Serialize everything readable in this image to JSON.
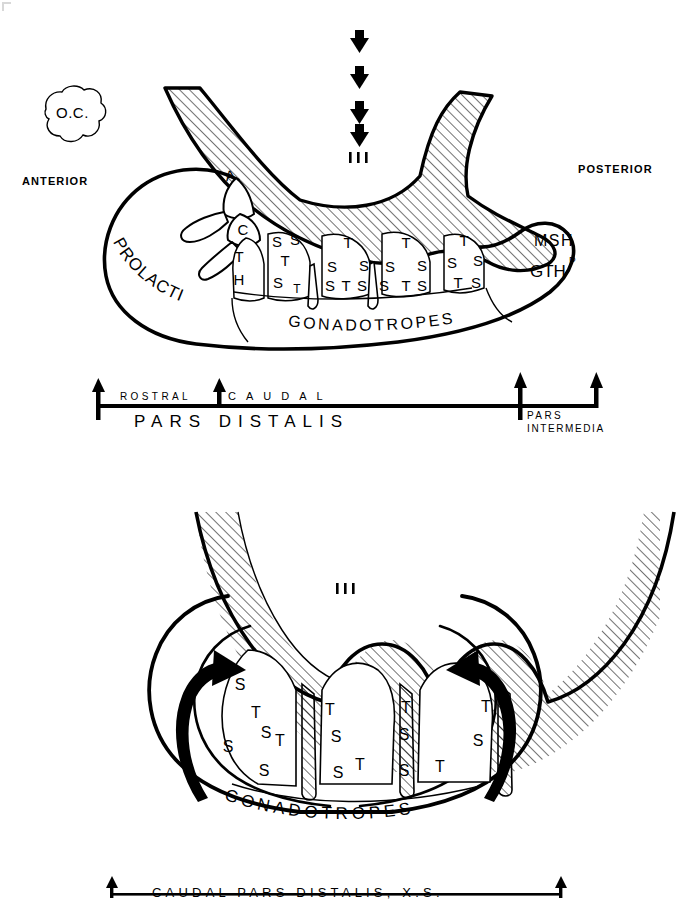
{
  "figure": {
    "type": "anatomical-diagram"
  },
  "panel_top": {
    "name": "sagittal-view",
    "labels": {
      "optic_chiasma": "O.C.",
      "anterior": "ANTERIOR",
      "posterior": "POSTERIOR",
      "ventricle": "III",
      "prolactin": "PROLACTIN",
      "gonadotropes": "GONADOTROPES",
      "msh": "MSH",
      "gth": "GTH",
      "gth_superscript": "P",
      "lobe_a": "A",
      "lobe_c": "C"
    },
    "arrows_down": 4,
    "cell_clusters": [
      {
        "name": "thyrotrope-cluster-1",
        "letters": [
          "T",
          "H"
        ]
      },
      {
        "name": "cluster-2",
        "letters": [
          "S",
          "S",
          "T",
          "S",
          "T"
        ]
      },
      {
        "name": "cluster-3",
        "letters": [
          "T",
          "S",
          "S",
          "S",
          "T",
          "S"
        ]
      },
      {
        "name": "cluster-4",
        "letters": [
          "T",
          "S",
          "S",
          "S",
          "T",
          "S"
        ]
      }
    ]
  },
  "scale_bar": {
    "name": "rostral-caudal-axis",
    "upper_left_label": "ROSTRAL",
    "upper_right_label": "CAUDAL",
    "lower_left_label": "PARS DISTALIS",
    "lower_right_label_line1": "PARS",
    "lower_right_label_line2": "INTERMEDIA",
    "tick_count": 4
  },
  "panel_bottom": {
    "name": "cross-section-view",
    "labels": {
      "ventricle": "III",
      "gonadotropes": "GONADOTROPES"
    },
    "curved_arrows": 2,
    "cell_clusters": [
      {
        "name": "left-cluster",
        "letters": [
          "S",
          "T",
          "S",
          "S",
          "T",
          "S"
        ]
      },
      {
        "name": "mid-left-cluster",
        "letters": [
          "T",
          "S",
          "S",
          "T"
        ]
      },
      {
        "name": "mid-right-cluster",
        "letters": [
          "T",
          "S",
          "S",
          "T"
        ]
      },
      {
        "name": "right-cluster",
        "letters": [
          "T",
          "S"
        ]
      }
    ]
  },
  "caption": {
    "name": "bottom-caption",
    "text": "CAUDAL PARS DISTALIS, X.S."
  },
  "colors": {
    "ink": "#000000",
    "paper": "#ffffff",
    "hatch": "#000000"
  }
}
